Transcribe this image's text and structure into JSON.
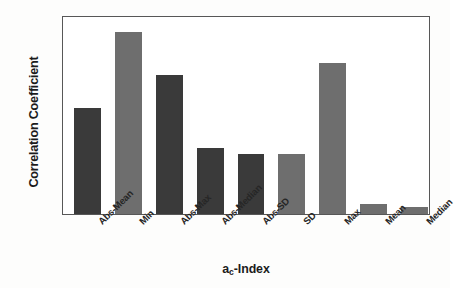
{
  "chart_data": {
    "type": "bar",
    "title": "",
    "xlabel": "ac-Index",
    "xlabel_base": "a",
    "xlabel_sub": "c",
    "xlabel_tail": "-Index",
    "ylabel": "Correlation Coefficient",
    "ylim": [
      0,
      0.6
    ],
    "ytick_labels": [
      "0",
      "0.1",
      "0.2",
      "0.3",
      "0.4",
      "0.5",
      "0.6"
    ],
    "ytick_values": [
      0,
      0.1,
      0.2,
      0.3,
      0.4,
      0.5,
      0.6
    ],
    "grid": false,
    "legend": "none",
    "categories": [
      "Abs-Mean",
      "Min",
      "Abs-Max",
      "Abs-Median",
      "Abs-SD",
      "SD",
      "Max",
      "Mean",
      "Median"
    ],
    "values": [
      0.32,
      0.55,
      0.42,
      0.2,
      0.18,
      0.18,
      0.455,
      0.03,
      0.02
    ],
    "bar_colors": [
      "#3a3a3a",
      "#6e6e6e",
      "#3a3a3a",
      "#3a3a3a",
      "#3a3a3a",
      "#6e6e6e",
      "#6e6e6e",
      "#6e6e6e",
      "#6e6e6e"
    ],
    "frame_color": "#575757",
    "text_color": "#1b1b1b",
    "background_color": "#ffffff"
  }
}
